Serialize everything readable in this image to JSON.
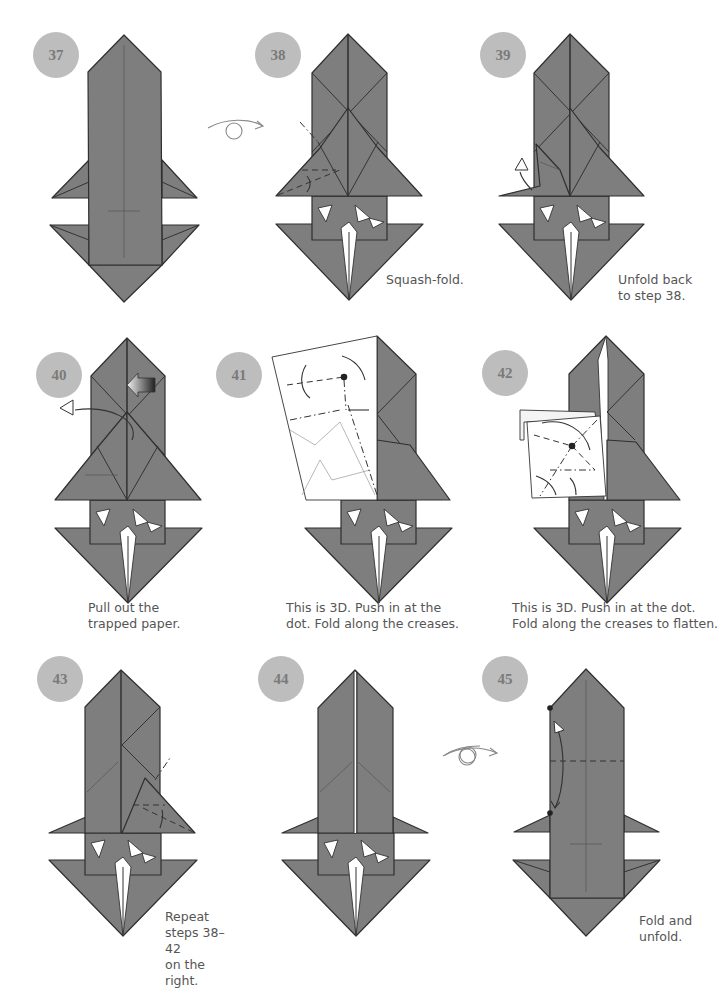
{
  "page": {
    "paper_color": "#7e7e7e",
    "badge_color": "#bdbdbd"
  },
  "steps": [
    {
      "number": "37",
      "caption": "",
      "icons": [
        "center-crease"
      ]
    },
    {
      "number": "38",
      "caption": "Squash-fold.",
      "icons": [
        "turn-over-arrow",
        "valley-fold-arrow"
      ]
    },
    {
      "number": "39",
      "caption": "Unfold back\nto step 38.",
      "icons": [
        "unfold-arrow"
      ]
    },
    {
      "number": "40",
      "caption": "Pull out the\ntrapped paper.",
      "icons": [
        "push-arrow",
        "pull-out-arrow"
      ]
    },
    {
      "number": "41",
      "caption": "This is 3D. Push in at the\ndot. Fold along the creases.",
      "icons": [
        "dot",
        "fold-arrows"
      ]
    },
    {
      "number": "42",
      "caption": "This is 3D. Push in at the dot.\nFold along the creases to flatten.",
      "icons": [
        "dot",
        "fold-arrows"
      ]
    },
    {
      "number": "43",
      "caption": "Repeat steps 38–42\non the right.",
      "icons": [
        "valley-fold-arrow"
      ]
    },
    {
      "number": "44",
      "caption": "",
      "icons": [
        "turn-over-arrow"
      ]
    },
    {
      "number": "45",
      "caption": "Fold and\nunfold.",
      "icons": [
        "turn-over-arrow",
        "fold-unfold-arrow",
        "dot"
      ]
    }
  ]
}
